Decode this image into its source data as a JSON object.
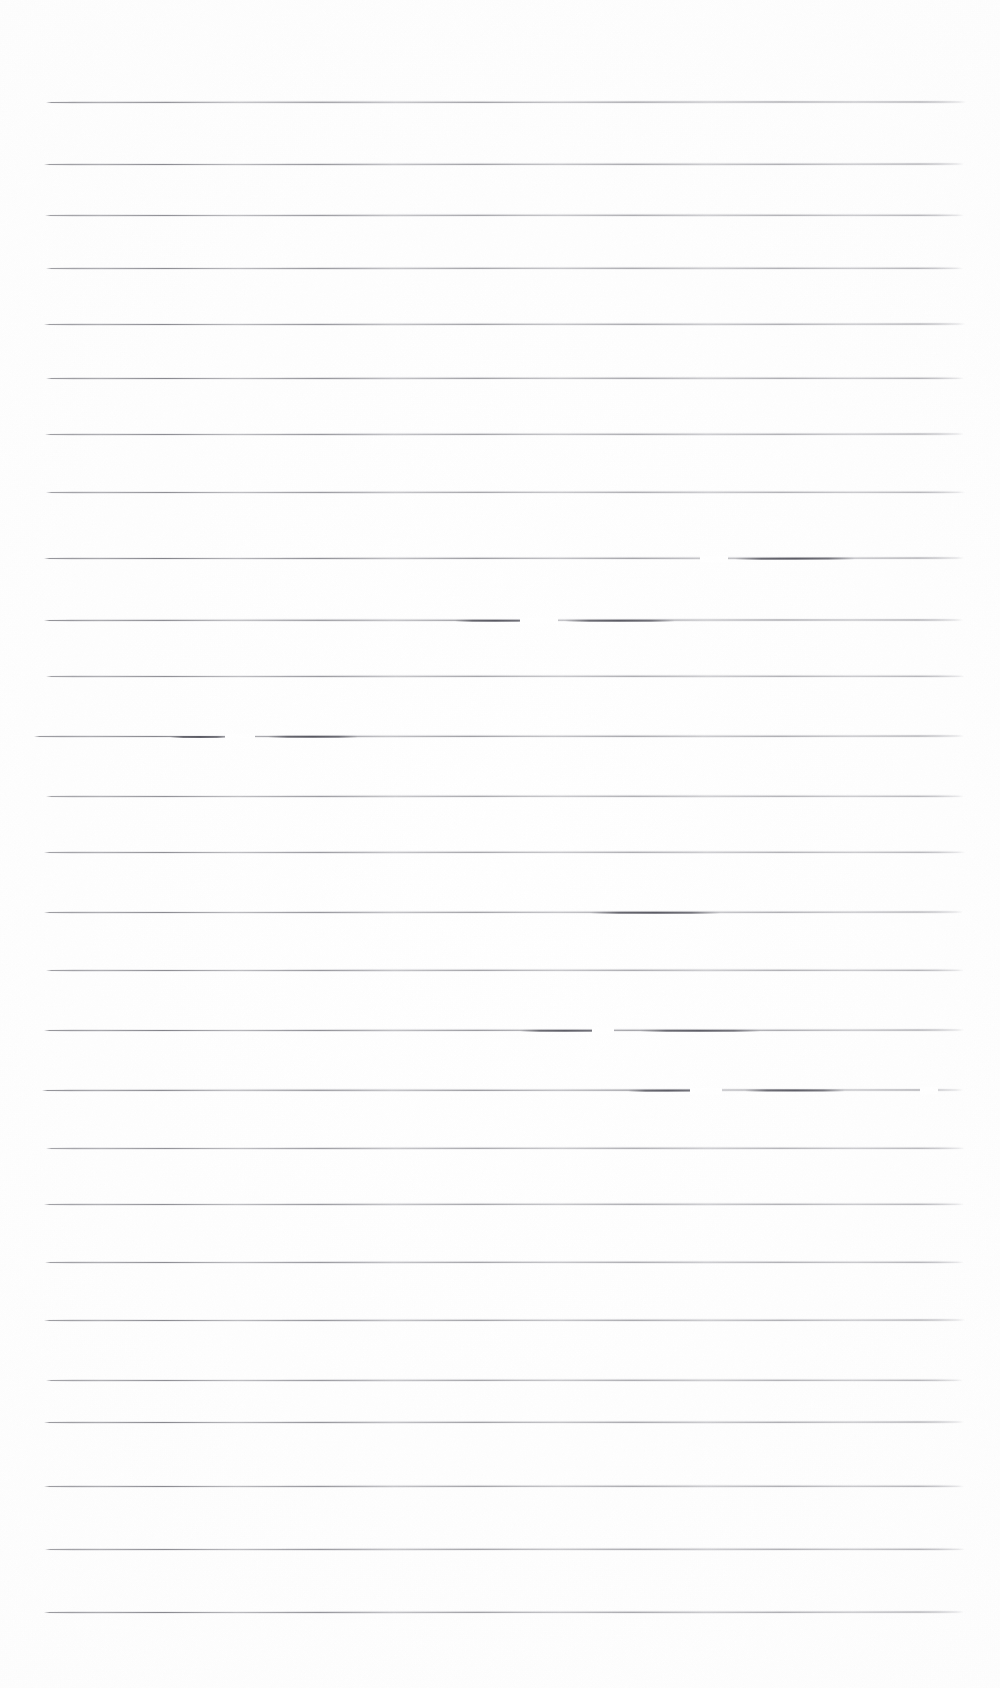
{
  "document": {
    "kind": "scanned-ruled-paper",
    "title": "Scanned lined notebook page",
    "description": "A blank scanned sheet of wide-ruled paper. No handwriting, printed text, headings, numbers or markings are present — only horizontal ruled lines.",
    "page_width": 1000,
    "page_height": 1688,
    "background_color": "#ffffff",
    "rule_color": "#6e6e76",
    "rule_thickness_px": 1.15,
    "rule_count": 25,
    "rule_left_x": 46,
    "rule_right_x": 966,
    "rule_spacing_px": 62.9,
    "first_rule_y": 102,
    "last_rule_y": 1612,
    "text_content": "",
    "margins": {
      "top_px": 102,
      "bottom_px": 76,
      "left_px": 46,
      "right_px": 34
    },
    "rules": [
      {
        "y": 102,
        "x1": 46,
        "x2": 966,
        "tilt": -0.55,
        "opacity": 0.82,
        "gaps": [],
        "blots": []
      },
      {
        "y": 164,
        "x1": 44,
        "x2": 964,
        "tilt": -0.45,
        "opacity": 0.78,
        "gaps": [],
        "blots": []
      },
      {
        "y": 215,
        "x1": 45,
        "x2": 964,
        "tilt": -0.4,
        "opacity": 0.74,
        "gaps": [],
        "blots": []
      },
      {
        "y": 268,
        "x1": 46,
        "x2": 963,
        "tilt": -0.4,
        "opacity": 0.76,
        "gaps": [],
        "blots": []
      },
      {
        "y": 324,
        "x1": 44,
        "x2": 965,
        "tilt": -0.45,
        "opacity": 0.78,
        "gaps": [],
        "blots": []
      },
      {
        "y": 378,
        "x1": 46,
        "x2": 964,
        "tilt": -0.4,
        "opacity": 0.8,
        "gaps": [],
        "blots": []
      },
      {
        "y": 434,
        "x1": 45,
        "x2": 964,
        "tilt": -0.45,
        "opacity": 0.76,
        "gaps": [],
        "blots": []
      },
      {
        "y": 492,
        "x1": 46,
        "x2": 965,
        "tilt": -0.4,
        "opacity": 0.74,
        "gaps": [],
        "blots": []
      },
      {
        "y": 558,
        "x1": 44,
        "x2": 964,
        "tilt": -0.5,
        "opacity": 0.84,
        "gaps": [
          [
            700,
            28
          ]
        ],
        "blots": [
          [
            735,
            120
          ]
        ]
      },
      {
        "y": 620,
        "x1": 44,
        "x2": 963,
        "tilt": -0.55,
        "opacity": 0.86,
        "gaps": [
          [
            520,
            38
          ]
        ],
        "blots": [
          [
            455,
            80
          ],
          [
            565,
            110
          ]
        ]
      },
      {
        "y": 676,
        "x1": 46,
        "x2": 965,
        "tilt": -0.35,
        "opacity": 0.74,
        "gaps": [],
        "blots": []
      },
      {
        "y": 736,
        "x1": 34,
        "x2": 964,
        "tilt": -0.5,
        "opacity": 0.8,
        "gaps": [
          [
            225,
            30
          ]
        ],
        "blots": [
          [
            170,
            60
          ],
          [
            268,
            90
          ]
        ]
      },
      {
        "y": 796,
        "x1": 46,
        "x2": 964,
        "tilt": -0.35,
        "opacity": 0.72,
        "gaps": [],
        "blots": []
      },
      {
        "y": 852,
        "x1": 44,
        "x2": 965,
        "tilt": -0.4,
        "opacity": 0.74,
        "gaps": [],
        "blots": []
      },
      {
        "y": 912,
        "x1": 44,
        "x2": 963,
        "tilt": -0.45,
        "opacity": 0.78,
        "gaps": [],
        "blots": [
          [
            590,
            130
          ]
        ]
      },
      {
        "y": 970,
        "x1": 46,
        "x2": 964,
        "tilt": -0.4,
        "opacity": 0.76,
        "gaps": [],
        "blots": []
      },
      {
        "y": 1030,
        "x1": 44,
        "x2": 964,
        "tilt": -0.5,
        "opacity": 0.84,
        "gaps": [
          [
            592,
            22
          ]
        ],
        "blots": [
          [
            520,
            90
          ],
          [
            640,
            120
          ]
        ]
      },
      {
        "y": 1090,
        "x1": 42,
        "x2": 963,
        "tilt": -0.55,
        "opacity": 0.86,
        "gaps": [
          [
            690,
            32
          ],
          [
            920,
            18
          ]
        ],
        "blots": [
          [
            628,
            80
          ],
          [
            745,
            100
          ]
        ]
      },
      {
        "y": 1148,
        "x1": 46,
        "x2": 965,
        "tilt": -0.35,
        "opacity": 0.72,
        "gaps": [],
        "blots": []
      },
      {
        "y": 1204,
        "x1": 44,
        "x2": 964,
        "tilt": -0.4,
        "opacity": 0.74,
        "gaps": [],
        "blots": []
      },
      {
        "y": 1262,
        "x1": 45,
        "x2": 964,
        "tilt": -0.4,
        "opacity": 0.76,
        "gaps": [],
        "blots": []
      },
      {
        "y": 1320,
        "x1": 44,
        "x2": 965,
        "tilt": -0.45,
        "opacity": 0.78,
        "gaps": [],
        "blots": []
      },
      {
        "y": 1380,
        "x1": 46,
        "x2": 963,
        "tilt": -0.35,
        "opacity": 0.74,
        "gaps": [],
        "blots": []
      },
      {
        "y": 1422,
        "x1": 44,
        "x2": 964,
        "tilt": -0.45,
        "opacity": 0.8,
        "gaps": [],
        "blots": []
      },
      {
        "y": 1486,
        "x1": 44,
        "x2": 964,
        "tilt": -0.4,
        "opacity": 0.78,
        "gaps": [],
        "blots": []
      },
      {
        "y": 1549,
        "x1": 45,
        "x2": 965,
        "tilt": -0.4,
        "opacity": 0.76,
        "gaps": [],
        "blots": []
      },
      {
        "y": 1612,
        "x1": 44,
        "x2": 964,
        "tilt": -0.45,
        "opacity": 0.8,
        "gaps": [],
        "blots": []
      }
    ]
  }
}
